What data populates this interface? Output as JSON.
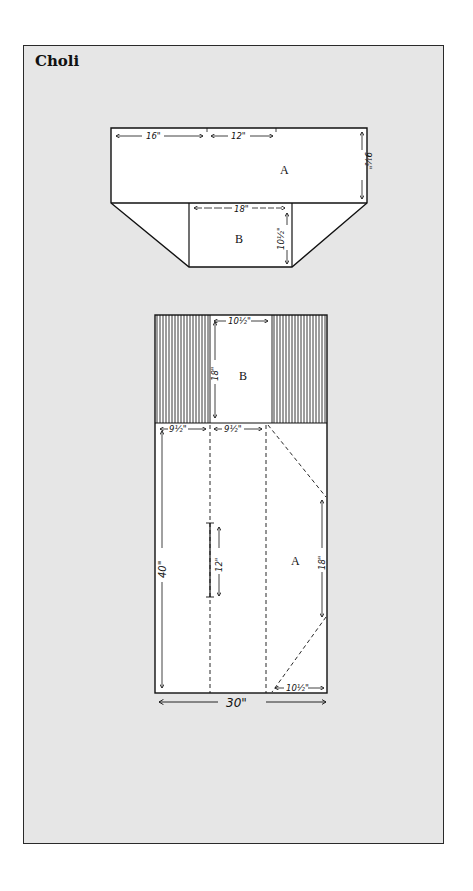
{
  "title": "Choli",
  "colors": {
    "frame_bg": "#e6e6e6",
    "paper": "#ffffff",
    "ink": "#111111"
  },
  "top_layout": {
    "pieces": [
      {
        "id": "A",
        "label": "A"
      },
      {
        "id": "B",
        "label": "B"
      }
    ],
    "dimensions": {
      "a_left_width": "16\"",
      "a_right_width": "12\"",
      "a_height": "9½\"",
      "b_width": "18\"",
      "b_height": "10½\""
    }
  },
  "cutting_layout": {
    "pieces": [
      {
        "id": "B",
        "label": "B"
      },
      {
        "id": "A",
        "label": "A"
      }
    ],
    "dimensions": {
      "b_width": "10½\"",
      "b_height": "18\"",
      "a_first_fold": "9½\"",
      "a_second_fold": "9½\"",
      "total_length": "40\"",
      "slit": "12\"",
      "side_taper": "18\"",
      "bottom_offset": "10½\"",
      "total_width": "30\""
    }
  }
}
